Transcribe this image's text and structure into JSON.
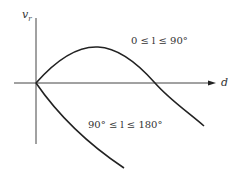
{
  "axes": {
    "y_label": "v",
    "y_label_sub": "r",
    "x_label": "d"
  },
  "curves": [
    {
      "name": "upper",
      "label": "0 ≤ l ≤ 90°"
    },
    {
      "name": "lower",
      "label": "90° ≤ l ≤ 180°"
    }
  ],
  "colors": {
    "line": "#222222",
    "axis": "#444444",
    "text": "#333333"
  }
}
